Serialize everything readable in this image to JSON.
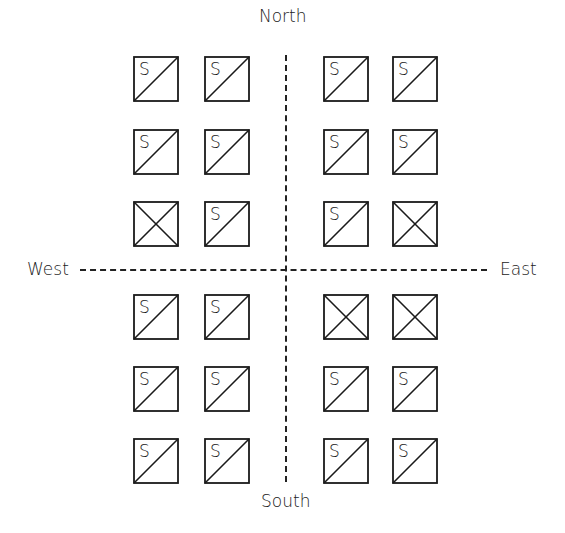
{
  "labels": {
    "north": "North",
    "south": "South",
    "west": "West",
    "east": "East"
  },
  "colors": {
    "stroke": "#1a1a1a",
    "background": "#ffffff"
  },
  "legend_glyph": "S",
  "grid": {
    "columns_x": [
      133,
      204,
      323,
      392
    ],
    "rows_y": [
      56,
      129,
      201,
      294,
      366,
      438
    ],
    "cells": [
      [
        "S",
        "S",
        "S",
        "S"
      ],
      [
        "S",
        "S",
        "S",
        "S"
      ],
      [
        "X",
        "S",
        "S",
        "X"
      ],
      [
        "S",
        "S",
        "X",
        "X"
      ],
      [
        "S",
        "S",
        "S",
        "S"
      ],
      [
        "S",
        "S",
        "S",
        "S"
      ]
    ]
  }
}
